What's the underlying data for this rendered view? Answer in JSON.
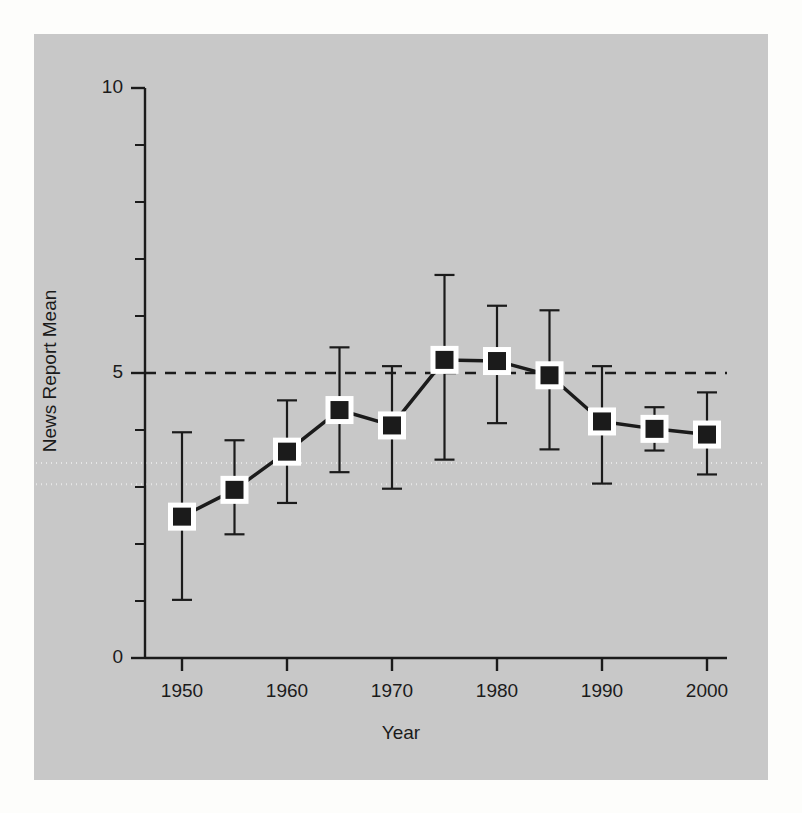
{
  "figure": {
    "background_color": "#fdfdfb",
    "panel_color": "#c8c8c8",
    "ink_color": "#1b1b1b",
    "marker_fill": "#1b1b1b",
    "marker_edge": "#ffffff"
  },
  "chart_data": {
    "type": "line",
    "title": "",
    "xlabel": "Year",
    "ylabel": "News Report Mean",
    "xlim": [
      1946.5,
      2003.5
    ],
    "ylim": [
      0,
      10
    ],
    "xticks": [
      1950,
      1960,
      1970,
      1980,
      1990,
      2000
    ],
    "xticklabels": [
      "1950",
      "1960",
      "1970",
      "1980",
      "1990",
      "2000"
    ],
    "yticks": [
      0,
      1,
      2,
      3,
      4,
      5,
      6,
      7,
      8,
      9,
      10
    ],
    "yticklabels_shown": [
      "0",
      "5",
      "10"
    ],
    "ytick_labeled_values": [
      0,
      5,
      10
    ],
    "grid": false,
    "legend": null,
    "x": [
      1950,
      1955,
      1960,
      1965,
      1970,
      1975,
      1980,
      1985,
      1990,
      1995,
      2000
    ],
    "series": [
      {
        "name": "News Report Mean",
        "values": [
          2.48,
          2.95,
          3.62,
          4.35,
          4.08,
          5.23,
          5.21,
          4.96,
          4.15,
          4.02,
          3.92
        ],
        "error_low": [
          1.02,
          2.17,
          2.72,
          3.26,
          2.97,
          3.48,
          4.12,
          3.66,
          3.06,
          3.64,
          3.22
        ],
        "error_high": [
          3.96,
          3.82,
          4.52,
          5.45,
          5.12,
          6.72,
          6.18,
          6.1,
          5.12,
          4.4,
          4.66
        ],
        "marker": "square",
        "line_color": "#1b1b1b",
        "line_width": 3.5
      }
    ],
    "reference_lines": [
      {
        "name": "mean-reference-line",
        "y": 5.0,
        "style": "dashed",
        "color": "#1b1b1b"
      },
      {
        "name": "upper-dotted-line",
        "y": 3.42,
        "style": "dotted",
        "color": "#e6e6e6"
      },
      {
        "name": "lower-dotted-line",
        "y": 3.05,
        "style": "dotted",
        "color": "#e6e6e6"
      }
    ]
  }
}
